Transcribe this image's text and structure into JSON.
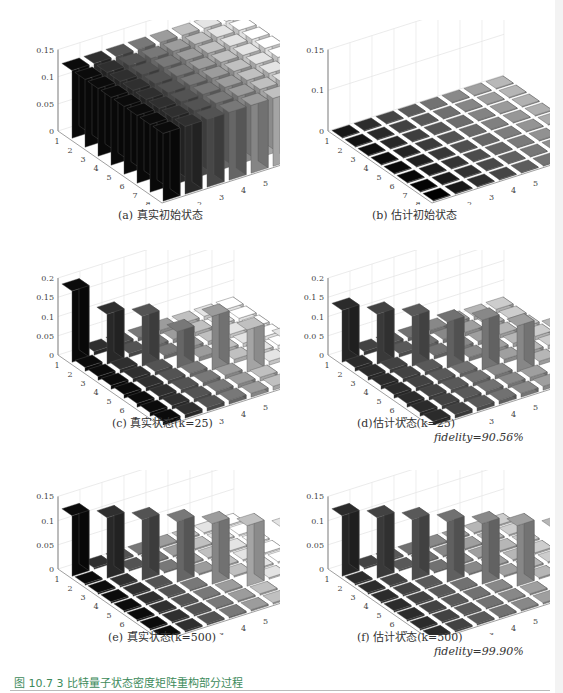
{
  "figure": {
    "caption": "图 10.7   3 比特量子状态密度矩阵重构部分过程",
    "caption_color": "#3c8a5a"
  },
  "panels": [
    {
      "id": "a",
      "caption": "(a) 真实初始状态",
      "fidelity": null
    },
    {
      "id": "b",
      "caption": "(b) 估计初始状态",
      "fidelity": null
    },
    {
      "id": "c",
      "caption": "(c) 真实状态(k=25)",
      "fidelity": null
    },
    {
      "id": "d",
      "caption": "(d)估计状态(k=25)",
      "fidelity": "fidelity=90.56%"
    },
    {
      "id": "e",
      "caption": "(e) 真实状态(k=500)",
      "fidelity": null
    },
    {
      "id": "f",
      "caption": "(f) 估计状态(k=500)",
      "fidelity": "fidelity=99.90%"
    }
  ],
  "chart_data": [
    {
      "id": "a",
      "type": "bar3d",
      "title": "(a) 真实初始状态",
      "x_ticks": [
        1,
        2,
        3,
        4,
        5,
        6,
        7,
        8
      ],
      "y_ticks": [
        1,
        2,
        3,
        4,
        5,
        6,
        7,
        8
      ],
      "z_ticks": [
        "0",
        "0.05",
        "0.1",
        "0.15"
      ],
      "zlim": [
        0,
        0.15
      ],
      "description": "uniform matrix, all 64 entries = 0.125",
      "diagonal": [
        0.125,
        0.125,
        0.125,
        0.125,
        0.125,
        0.125,
        0.125,
        0.125
      ],
      "off_diagonal": 0.125
    },
    {
      "id": "b",
      "type": "bar3d",
      "title": "(b) 估计初始状态",
      "x_ticks": [
        1,
        2,
        3,
        4,
        5,
        6,
        7,
        8
      ],
      "y_ticks": [
        1,
        2,
        3,
        4,
        5,
        6,
        7,
        8
      ],
      "z_ticks": [
        "0",
        "0.1",
        "0.15"
      ],
      "zlim": [
        0,
        0.15
      ],
      "description": "single nonzero element at (8,8)",
      "diagonal": [
        0,
        0,
        0,
        0,
        0,
        0,
        0,
        0.125
      ],
      "off_diagonal": 0
    },
    {
      "id": "c",
      "type": "bar3d",
      "title": "(c) 真实状态(k=25)",
      "x_ticks": [
        1,
        2,
        3,
        4,
        5,
        6,
        7,
        8
      ],
      "y_ticks": [
        1,
        2,
        3,
        4,
        5,
        6,
        7,
        8
      ],
      "z_ticks": [
        "0",
        "0.05",
        "0.1",
        "0.15",
        "0.2"
      ],
      "zlim": [
        0,
        0.2
      ],
      "diagonal": [
        0.185,
        0.13,
        0.13,
        0.095,
        0.14,
        0.11,
        0.095,
        0.06
      ],
      "off_diagonal": 0.01
    },
    {
      "id": "d",
      "type": "bar3d",
      "title": "(d)估计状态(k=25)",
      "x_ticks": [
        1,
        2,
        3,
        4,
        5,
        6,
        7,
        8
      ],
      "y_ticks": [
        1,
        2,
        3,
        4,
        5,
        6,
        7,
        8
      ],
      "z_ticks": [
        "0",
        "0.0 5",
        "0.1",
        "0.1 5",
        "0.2"
      ],
      "zlim": [
        0,
        0.2
      ],
      "diagonal": [
        0.135,
        0.13,
        0.13,
        0.12,
        0.13,
        0.12,
        0.12,
        0.135
      ],
      "off_diagonal": 0.01,
      "fidelity": "90.56%"
    },
    {
      "id": "e",
      "type": "bar3d",
      "title": "(e) 真实状态(k=500)",
      "x_ticks": [
        1,
        2,
        3,
        4,
        5,
        6,
        7
      ],
      "y_ticks": [
        1,
        2,
        3,
        4,
        5,
        6,
        7,
        8
      ],
      "z_ticks": [
        "0",
        "0.05",
        "0.1",
        "0.15"
      ],
      "zlim": [
        0,
        0.15
      ],
      "diagonal": [
        0.125,
        0.125,
        0.125,
        0.125,
        0.125,
        0.125,
        0.125,
        0.125
      ],
      "off_diagonal": 0.003
    },
    {
      "id": "f",
      "type": "bar3d",
      "title": "(f) 估计状态(k=500)",
      "x_ticks": [
        1,
        2,
        3,
        4,
        5,
        6,
        7,
        8
      ],
      "y_ticks": [
        1,
        2,
        3,
        4,
        5,
        6,
        7,
        8
      ],
      "z_ticks": [
        "0",
        "0.05",
        "0.1",
        "0.15"
      ],
      "zlim": [
        0,
        0.15
      ],
      "diagonal": [
        0.125,
        0.125,
        0.125,
        0.125,
        0.125,
        0.125,
        0.125,
        0.125
      ],
      "off_diagonal": 0.003,
      "fidelity": "99.90%"
    }
  ]
}
